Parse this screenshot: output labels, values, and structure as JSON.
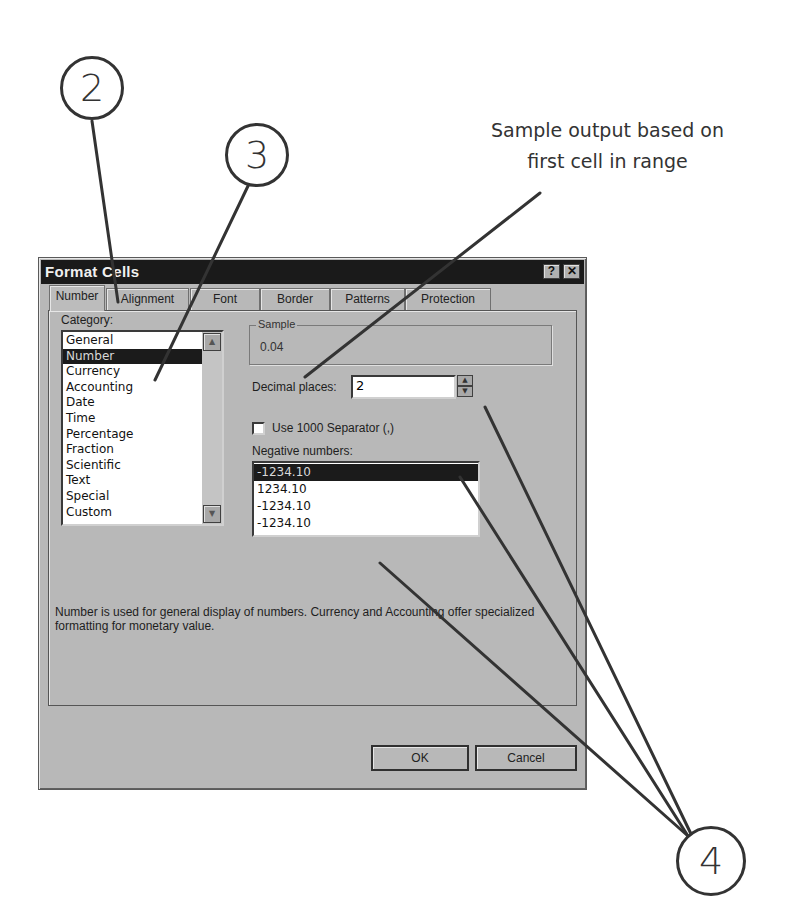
{
  "dialog": {
    "title": "Format Cells",
    "help_button": "?",
    "close_button": "✕",
    "tabs": [
      {
        "label": "Number",
        "active": true
      },
      {
        "label": "Alignment",
        "active": false
      },
      {
        "label": "Font",
        "active": false
      },
      {
        "label": "Border",
        "active": false
      },
      {
        "label": "Patterns",
        "active": false
      },
      {
        "label": "Protection",
        "active": false
      }
    ],
    "category": {
      "label": "Category:",
      "items": [
        "General",
        "Number",
        "Currency",
        "Accounting",
        "Date",
        "Time",
        "Percentage",
        "Fraction",
        "Scientific",
        "Text",
        "Special",
        "Custom"
      ],
      "selected": "Number"
    },
    "sample": {
      "label": "Sample",
      "value": "0.04"
    },
    "decimal_places": {
      "label": "Decimal places:",
      "value": "2"
    },
    "separator_checkbox": {
      "label": "Use 1000 Separator (,)",
      "checked": false
    },
    "negative_numbers": {
      "label": "Negative numbers:",
      "items": [
        "-1234.10",
        "1234.10",
        "-1234.10",
        "-1234.10"
      ],
      "selected_index": 0
    },
    "description": "Number is used for general display of numbers.  Currency and Accounting offer specialized formatting for monetary value.",
    "ok_label": "OK",
    "cancel_label": "Cancel"
  },
  "annotations": {
    "callout_2": "2",
    "callout_3": "3",
    "callout_4": "4",
    "sample_note_line1": "Sample output based on",
    "sample_note_line2": "first cell in range"
  }
}
